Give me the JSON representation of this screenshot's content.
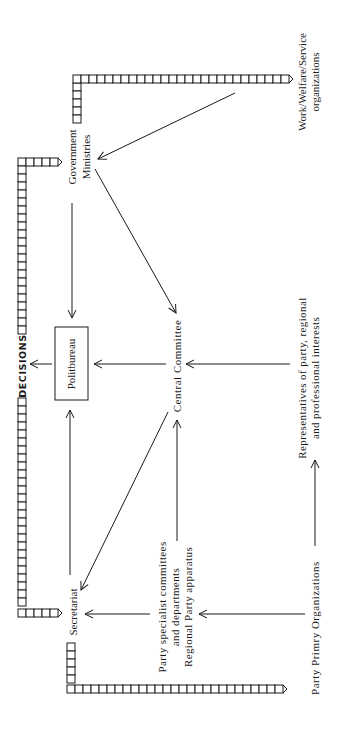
{
  "diagram": {
    "orientation": "rotated-90-ccw",
    "colors": {
      "ink": "#1a1a1a",
      "background": "#ffffff"
    },
    "nodes": {
      "politbureau": {
        "label": "Politbureau",
        "boxed": true
      },
      "government_ministries": {
        "lines": [
          "Government",
          "Ministries"
        ]
      },
      "central_committee": {
        "label": "Central Committee"
      },
      "secretariat": {
        "label": "Secretariat"
      },
      "party_specialist": {
        "lines": [
          "Party specialist committees",
          "and departments",
          "Regional Party apparatus"
        ]
      },
      "representatives": {
        "lines": [
          "Representatives of party, regional",
          "and professional interests"
        ]
      },
      "work_welfare": {
        "lines": [
          "Work/Welfare/Service",
          "organizations"
        ]
      },
      "party_primary": {
        "label": "Party Primry Organizations"
      }
    },
    "decisions_label": "DECISIONS",
    "edges": [
      {
        "from": "Work/Welfare/Service organizations",
        "to": "Government Ministries"
      },
      {
        "from": "Government Ministries",
        "to": "Politbureau"
      },
      {
        "from": "Government Ministries",
        "to": "Central Committee"
      },
      {
        "from": "Central Committee",
        "to": "Politbureau"
      },
      {
        "from": "Central Committee",
        "to": "Secretariat"
      },
      {
        "from": "Secretariat",
        "to": "Politbureau"
      },
      {
        "from": "Representatives of party, regional and professional interests",
        "to": "Central Committee"
      },
      {
        "from": "Party specialist committees and departments / Regional Party apparatus",
        "to": "Secretariat"
      },
      {
        "from": "Party specialist committees and departments / Regional Party apparatus",
        "to": "Central Committee"
      },
      {
        "from": "Party Primry Organizations",
        "to": "Party specialist committees and departments / Regional Party apparatus"
      },
      {
        "from": "Party Primry Organizations",
        "to": "Representatives of party, regional and professional interests"
      },
      {
        "from": "Politbureau",
        "to": "DECISIONS"
      }
    ]
  }
}
